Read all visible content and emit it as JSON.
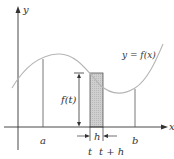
{
  "axes": {
    "x_label": "x",
    "y_label": "y"
  },
  "curve": {
    "label": "y = f(x)",
    "color": "#b5b5b5"
  },
  "points": {
    "a": "a",
    "b": "b",
    "t": "t",
    "t_plus_h": "t + h"
  },
  "rectangle": {
    "height_label": "f(t)",
    "width_label": "h",
    "fill": "#c8c8c8"
  }
}
